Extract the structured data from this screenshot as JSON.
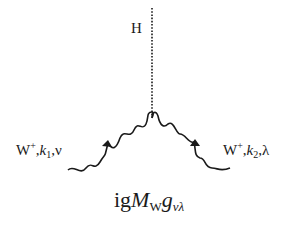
{
  "diagram": {
    "type": "feynman_vertex",
    "higgs": {
      "label": "H",
      "line_style": "dashed"
    },
    "incoming": {
      "particle": "W",
      "charge": "+",
      "momentum": "k",
      "momentum_index": "1",
      "lorentz_index": "ν",
      "line_style": "wavy",
      "separator": ","
    },
    "outgoing": {
      "particle": "W",
      "charge": "+",
      "momentum": "k",
      "momentum_index": "2",
      "lorentz_index": "λ",
      "line_style": "wavy",
      "separator": ","
    },
    "vertex_factor": {
      "prefix": "ig",
      "mass_symbol": "M",
      "mass_subscript": "W",
      "metric_symbol": "g",
      "metric_subscript": "νλ"
    },
    "colors": {
      "ink": "#1a1a1a",
      "background": "#ffffff"
    }
  }
}
